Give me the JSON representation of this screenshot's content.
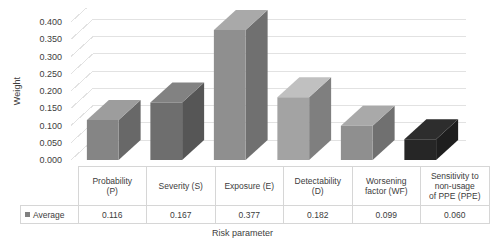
{
  "chart_data": {
    "type": "bar",
    "title": "",
    "xlabel": "Risk parameter",
    "ylabel": "Weight",
    "categories": [
      "Probability (P)",
      "Severity (S)",
      "Exposure (E)",
      "Detectability (D)",
      "Worsening factor (WF)",
      "Sensitivity to non-usage of PPE (PPE)"
    ],
    "category_lines": [
      [
        "Probability",
        "(P)"
      ],
      [
        "Severity (S)"
      ],
      [
        "Exposure (E)"
      ],
      [
        "Detectability",
        "(D)"
      ],
      [
        "Worsening",
        "factor (WF)"
      ],
      [
        "Sensitivity to",
        "non-usage",
        "of PPE (PPE)"
      ]
    ],
    "series": [
      {
        "name": "Average",
        "values": [
          0.116,
          0.167,
          0.377,
          0.182,
          0.099,
          0.06
        ],
        "value_labels": [
          "0.116",
          "0.167",
          "0.377",
          "0.182",
          "0.099",
          "0.060"
        ],
        "bar_colors": [
          "#858585",
          "#6e6e6e",
          "#8f8f8f",
          "#a3a3a3",
          "#8f8f8f",
          "#262626"
        ]
      }
    ],
    "ylim": [
      0.0,
      0.4
    ],
    "ytick_values": [
      0.4,
      0.35,
      0.3,
      0.25,
      0.2,
      0.15,
      0.1,
      0.05,
      0.0
    ],
    "ytick_labels": [
      "0.400",
      "0.350",
      "0.300",
      "0.250",
      "0.200",
      "0.150",
      "0.100",
      "0.050",
      "0.000"
    ],
    "grid": true,
    "legend_position": "data-table-row",
    "legend_entries": [
      "Average"
    ],
    "style": "3d-column",
    "colors": {
      "gridline": "#e2e2e2",
      "table_border": "#d6d6d6",
      "text": "#3c3c3c",
      "legend_swatch": "#808080"
    }
  },
  "legend": {
    "label": "Average"
  }
}
